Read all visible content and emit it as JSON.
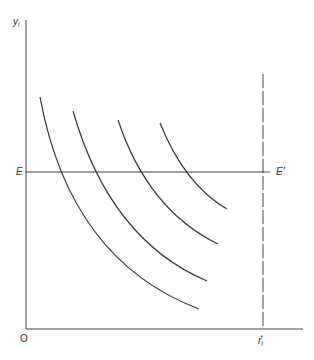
{
  "diagram": {
    "y_axis_label": "y",
    "y_axis_subscript": "i",
    "origin_label": "O",
    "x_axis_label": "r",
    "x_axis_subscript": "i",
    "x_axis_superscript": "*",
    "line_left_label": "E",
    "line_right_label": "E'",
    "colors": {
      "stroke": "#333333",
      "background": "#ffffff"
    },
    "curves": [
      {
        "name": "indifference-curve-1",
        "start": [
          40,
          97
        ],
        "cross_E": [
          59,
          172
        ],
        "end": [
          199,
          309
        ]
      },
      {
        "name": "indifference-curve-2",
        "start": [
          73,
          111
        ],
        "cross_E": [
          97,
          172
        ],
        "end": [
          207,
          281
        ]
      },
      {
        "name": "indifference-curve-3",
        "start": [
          118,
          120
        ],
        "cross_E": [
          141,
          172
        ],
        "end": [
          218,
          244
        ]
      },
      {
        "name": "indifference-curve-4",
        "start": [
          160,
          123
        ],
        "cross_E": [
          187,
          172
        ],
        "end": [
          227,
          209
        ]
      }
    ],
    "dashed_line": {
      "x": 263,
      "top": 74,
      "bottom": 329
    },
    "horizontal_line": {
      "y": 172,
      "left": 26,
      "right": 270
    }
  }
}
